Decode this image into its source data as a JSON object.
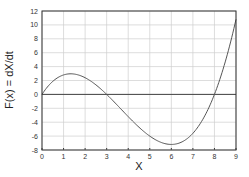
{
  "chart_data": {
    "type": "line",
    "title": "",
    "xlabel": "X",
    "ylabel": "F(x) = dX/dt",
    "xlim": [
      0,
      9
    ],
    "ylim": [
      -8,
      12
    ],
    "x_ticks": [
      "0",
      "1",
      "2",
      "3",
      "4",
      "5",
      "6",
      "7",
      "8",
      "9"
    ],
    "y_ticks": [
      "-8",
      "-6",
      "-4",
      "-2",
      "0",
      "2",
      "4",
      "6",
      "8",
      "10",
      "12"
    ],
    "grid": true,
    "legend": null,
    "series": [
      {
        "name": "F(x)",
        "x": [
          0,
          0.5,
          1,
          1.3,
          1.5,
          2,
          2.5,
          3,
          3.5,
          4,
          4.5,
          5,
          5.5,
          6,
          6.5,
          7,
          7.5,
          8,
          8.5,
          9
        ],
        "y": [
          0,
          2.75,
          2.8,
          2.96,
          2.93,
          2.4,
          1.38,
          0,
          -1.58,
          -3.2,
          -4.73,
          -6.0,
          -6.88,
          -7.2,
          -6.83,
          -5.6,
          -3.38,
          0,
          4.68,
          10.8
        ]
      }
    ],
    "zero_line": 0
  },
  "labels": {
    "xlabel": "X",
    "ylabel": "F(x) = dX/dt"
  }
}
